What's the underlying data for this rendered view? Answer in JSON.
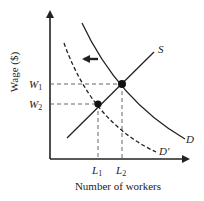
{
  "diagram": {
    "type": "labor-market-supply-demand",
    "y_axis_label": "Wage ($)",
    "x_axis_label": "Number of workers",
    "curves": {
      "supply": {
        "label": "S",
        "style": "solid"
      },
      "demand": {
        "label": "D",
        "style": "solid"
      },
      "demand_shifted": {
        "label": "D′",
        "style": "dashed"
      }
    },
    "wage_levels": [
      {
        "id": "W1",
        "base": "W",
        "sub": "1"
      },
      {
        "id": "W2",
        "base": "W",
        "sub": "2"
      }
    ],
    "quantity_levels": [
      {
        "id": "L1",
        "base": "L",
        "sub": "1"
      },
      {
        "id": "L2",
        "base": "L",
        "sub": "2"
      }
    ],
    "equilibria": [
      {
        "wage": "W1",
        "quantity": "L2",
        "description": "original equilibrium (S ∩ D)"
      },
      {
        "wage": "W2",
        "quantity": "L1",
        "description": "new equilibrium (S ∩ D′)"
      }
    ],
    "shift_arrow": {
      "direction": "left",
      "meaning": "demand decreases from D to D′"
    },
    "colors": {
      "line": "#222222",
      "background": "#ffffff"
    }
  }
}
